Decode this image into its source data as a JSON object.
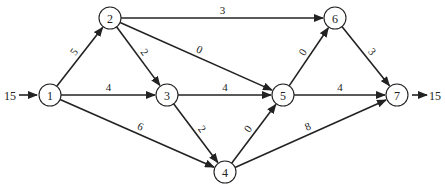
{
  "diagram": {
    "type": "network-flow",
    "source_flow": {
      "label": "15",
      "into_node": "1"
    },
    "sink_flow": {
      "label": "15",
      "from_node": "7"
    },
    "nodes": [
      {
        "id": "1",
        "label": "1",
        "x": 50,
        "y": 95
      },
      {
        "id": "2",
        "label": "2",
        "x": 110,
        "y": 18
      },
      {
        "id": "3",
        "label": "3",
        "x": 167,
        "y": 95
      },
      {
        "id": "4",
        "label": "4",
        "x": 225,
        "y": 172
      },
      {
        "id": "5",
        "label": "5",
        "x": 283,
        "y": 95
      },
      {
        "id": "6",
        "label": "6",
        "x": 335,
        "y": 18
      },
      {
        "id": "7",
        "label": "7",
        "x": 397,
        "y": 95
      }
    ],
    "edges": [
      {
        "from": "1",
        "to": "2",
        "label": "5"
      },
      {
        "from": "1",
        "to": "3",
        "label": "4"
      },
      {
        "from": "1",
        "to": "4",
        "label": "6"
      },
      {
        "from": "2",
        "to": "3",
        "label": "2"
      },
      {
        "from": "2",
        "to": "5",
        "label": "0"
      },
      {
        "from": "2",
        "to": "6",
        "label": "3"
      },
      {
        "from": "3",
        "to": "5",
        "label": "4"
      },
      {
        "from": "3",
        "to": "4",
        "label": "2"
      },
      {
        "from": "4",
        "to": "5",
        "label": "0"
      },
      {
        "from": "4",
        "to": "7",
        "label": "8"
      },
      {
        "from": "5",
        "to": "6",
        "label": "0"
      },
      {
        "from": "5",
        "to": "7",
        "label": "4"
      },
      {
        "from": "6",
        "to": "7",
        "label": "3"
      }
    ]
  }
}
